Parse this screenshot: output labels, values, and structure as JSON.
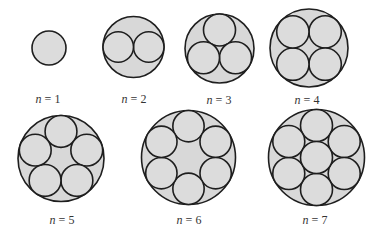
{
  "figure": {
    "colors": {
      "fill": "#d8d8d8",
      "stroke": "#1e1e1e"
    },
    "panels": [
      {
        "n": 1,
        "var": "n",
        "eq": " = 1",
        "cx": 49,
        "cy": 48,
        "R": 17,
        "label_x": 48,
        "label_y": 99
      },
      {
        "n": 2,
        "var": "n",
        "eq": " = 2",
        "cx": 133.5,
        "cy": 47,
        "R": 30.5,
        "label_x": 134,
        "label_y": 99
      },
      {
        "n": 3,
        "var": "n",
        "eq": " = 3",
        "cx": 219.5,
        "cy": 48.5,
        "R": 34.5,
        "label_x": 219,
        "label_y": 100
      },
      {
        "n": 4,
        "var": "n",
        "eq": " = 4",
        "cx": 309,
        "cy": 48,
        "R": 39,
        "label_x": 307,
        "label_y": 100
      },
      {
        "n": 5,
        "var": "n",
        "eq": " = 5",
        "cx": 61,
        "cy": 158.5,
        "R": 43,
        "label_x": 62,
        "label_y": 220
      },
      {
        "n": 6,
        "var": "n",
        "eq": " = 6",
        "cx": 188.5,
        "cy": 157.5,
        "R": 47,
        "label_x": 189,
        "label_y": 220
      },
      {
        "n": 7,
        "var": "n",
        "eq": " = 7",
        "cx": 316.5,
        "cy": 157.5,
        "R": 48,
        "label_x": 315,
        "label_y": 220
      }
    ]
  }
}
